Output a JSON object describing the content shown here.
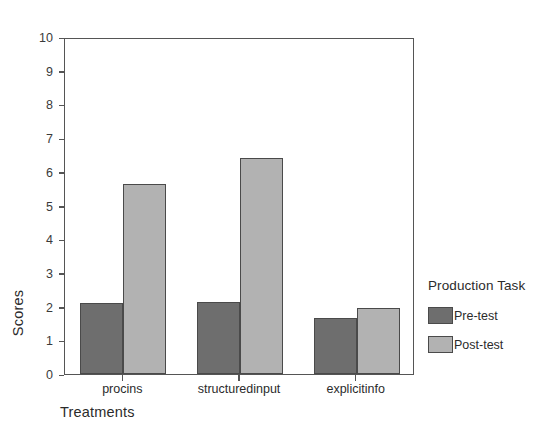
{
  "chart_data": {
    "type": "bar",
    "title": "",
    "xlabel": "Treatments",
    "ylabel": "Scores",
    "ylim": [
      0,
      10
    ],
    "yticks": [
      0,
      1,
      2,
      3,
      4,
      5,
      6,
      7,
      8,
      9,
      10
    ],
    "grid": false,
    "categories": [
      "procins",
      "structuredinput",
      "explicitinfo"
    ],
    "series": [
      {
        "name": "Pre-test",
        "color": "#6e6e6e",
        "values": [
          2.1,
          2.15,
          1.65
        ]
      },
      {
        "name": "Post-test",
        "color": "#b2b2b2",
        "values": [
          5.65,
          6.4,
          1.95
        ]
      }
    ],
    "legend": {
      "title": "Production Task",
      "position": "right",
      "entries": [
        {
          "label": "Pre-test",
          "swatch": "#6e6e6e"
        },
        {
          "label": "Post-test",
          "swatch": "#b2b2b2"
        }
      ]
    }
  }
}
